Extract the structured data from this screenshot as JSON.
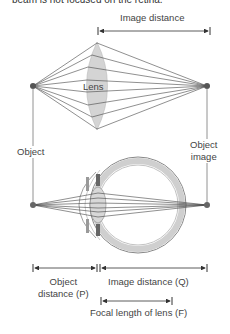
{
  "caption": "beam is not focused on the retina.",
  "labels": {
    "image_distance_top": "Image distance",
    "lens": "Lens",
    "object": "Object",
    "object_image_line1": "Object",
    "object_image_line2": "image",
    "object_distance_line1": "Object",
    "object_distance_line2": "distance (P)",
    "image_distance_q": "Image distance (Q)",
    "focal_length": "Focal length of lens (F)"
  },
  "colors": {
    "lens_fill": "#d4d4d4",
    "line": "#444444",
    "eye_wall": "#cfcfcf",
    "point": "#555555"
  }
}
